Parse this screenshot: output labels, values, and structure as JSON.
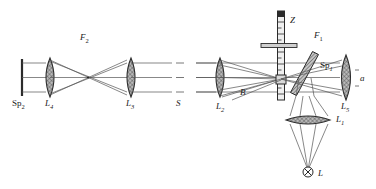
{
  "figure": {
    "background_color": "#ffffff",
    "line_color": "#3a3a3a",
    "lens_fill": "#a8a8a8",
    "width": 376,
    "height": 189
  },
  "labels": {
    "f2": {
      "base": "F",
      "sub": "2"
    },
    "sp2": {
      "base": "Sp",
      "sub": "2"
    },
    "l4": {
      "base": "L",
      "sub": "4"
    },
    "l3": {
      "base": "L",
      "sub": "3"
    },
    "s": {
      "base": "S",
      "sub": ""
    },
    "z": {
      "base": "Z",
      "sub": ""
    },
    "f1": {
      "base": "F",
      "sub": "1"
    },
    "sp1": {
      "base": "Sp",
      "sub": "1"
    },
    "b": {
      "base": "B",
      "sub": ""
    },
    "l2": {
      "base": "L",
      "sub": "2"
    },
    "l5": {
      "base": "L",
      "sub": "5"
    },
    "a": {
      "base": "a",
      "sub": ""
    },
    "l1": {
      "base": "L",
      "sub": "1"
    },
    "lamp": {
      "base": "L",
      "sub": ""
    }
  },
  "components": [
    {
      "name": "screen-sp2",
      "type": "screen",
      "label": "Sp2"
    },
    {
      "name": "lens-l4",
      "type": "lens",
      "label": "L4"
    },
    {
      "name": "lens-l3",
      "type": "lens",
      "label": "L3"
    },
    {
      "name": "beam-path-f2",
      "type": "beam-region",
      "label": "F2"
    },
    {
      "name": "slit-s",
      "type": "slit",
      "label": "S"
    },
    {
      "name": "lens-l2",
      "type": "lens",
      "label": "L2"
    },
    {
      "name": "scale-z",
      "type": "graduated-scale",
      "label": "Z"
    },
    {
      "name": "beam-path-f1",
      "type": "beam-region",
      "label": "F1"
    },
    {
      "name": "beamsplitter-sp1",
      "type": "beamsplitter",
      "label": "Sp1"
    },
    {
      "name": "aperture-b",
      "type": "aperture",
      "label": "B"
    },
    {
      "name": "lens-l5",
      "type": "lens",
      "label": "L5"
    },
    {
      "name": "aperture-a",
      "type": "aperture",
      "label": "a"
    },
    {
      "name": "lens-l1",
      "type": "lens",
      "label": "L1"
    },
    {
      "name": "lamp-l",
      "type": "light-source",
      "label": "L"
    }
  ]
}
